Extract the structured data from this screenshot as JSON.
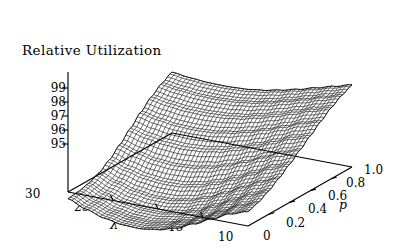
{
  "figure": {
    "title": "Relative Utilization",
    "background": "#ffffff",
    "ink": "#000000"
  },
  "axes": {
    "z": {
      "name": "Relative Utilization",
      "ticks": [
        "99",
        "98",
        "97",
        "96",
        "95"
      ],
      "values": [
        99,
        98,
        97,
        96,
        95
      ],
      "range": [
        95,
        99.6
      ]
    },
    "x": {
      "name": "λ",
      "ticks": [
        "30",
        "25",
        "20",
        "15",
        "10"
      ],
      "values": [
        30,
        25,
        20,
        15,
        10
      ],
      "range": [
        10,
        30
      ]
    },
    "y": {
      "name": "p",
      "ticks": [
        "0",
        "0.2",
        "0.4",
        "0.6",
        "0.8",
        "1.0"
      ],
      "values": [
        0,
        0.2,
        0.4,
        0.6,
        0.8,
        1.0
      ],
      "range": [
        0,
        1.0
      ]
    }
  },
  "chart_data": {
    "type": "surface",
    "title": "Relative Utilization",
    "xlabel": "λ",
    "ylabel": "p",
    "zlabel": "Relative Utilization",
    "xlim": [
      10,
      30
    ],
    "ylim": [
      0,
      1.0
    ],
    "zlim": [
      95,
      99.6
    ],
    "grid": false,
    "legend": "none",
    "style": "wireframe-mesh",
    "x": [
      30,
      28,
      26,
      24,
      22,
      20,
      18,
      16,
      14,
      12,
      10
    ],
    "y": [
      0.0,
      0.1,
      0.2,
      0.3,
      0.4,
      0.5,
      0.6,
      0.7,
      0.8,
      0.9,
      1.0
    ],
    "z_note": "z[i][j] = Relative Utilization at x=lambda[i], y=p[j]; surface forms a valley minimum near lambda 18-22 at low p, rising steeply toward lambda=30 at high p.",
    "z": [
      [
        99.45,
        99.7,
        100.1,
        100.6,
        101.15,
        101.75,
        102.35,
        102.95,
        103.5,
        103.95,
        104.3
      ],
      [
        99.05,
        99.25,
        99.6,
        100.1,
        100.7,
        101.35,
        102.0,
        102.6,
        103.15,
        103.6,
        103.95
      ],
      [
        98.45,
        98.6,
        98.95,
        99.45,
        100.05,
        100.75,
        101.45,
        102.1,
        102.7,
        103.2,
        103.6
      ],
      [
        97.85,
        97.98,
        98.3,
        98.8,
        99.45,
        100.2,
        100.95,
        101.65,
        102.3,
        102.85,
        103.25
      ],
      [
        97.3,
        97.42,
        97.72,
        98.22,
        98.9,
        99.7,
        100.5,
        101.25,
        101.95,
        102.5,
        102.95
      ],
      [
        96.95,
        97.05,
        97.32,
        97.8,
        98.48,
        99.3,
        100.15,
        100.95,
        101.65,
        102.25,
        102.7
      ],
      [
        96.78,
        96.88,
        97.12,
        97.58,
        98.25,
        99.08,
        99.95,
        100.75,
        101.5,
        102.1,
        102.55
      ],
      [
        96.82,
        96.92,
        97.15,
        97.58,
        98.22,
        99.02,
        99.88,
        100.7,
        101.45,
        102.05,
        102.5
      ],
      [
        97.05,
        97.15,
        97.36,
        97.75,
        98.35,
        99.12,
        99.95,
        100.75,
        101.48,
        102.08,
        102.52
      ],
      [
        97.45,
        97.54,
        97.74,
        98.1,
        98.65,
        99.38,
        100.15,
        100.92,
        101.62,
        102.2,
        102.62
      ],
      [
        97.95,
        98.04,
        98.22,
        98.55,
        99.06,
        99.72,
        100.45,
        101.18,
        101.84,
        102.38,
        102.78
      ]
    ]
  }
}
